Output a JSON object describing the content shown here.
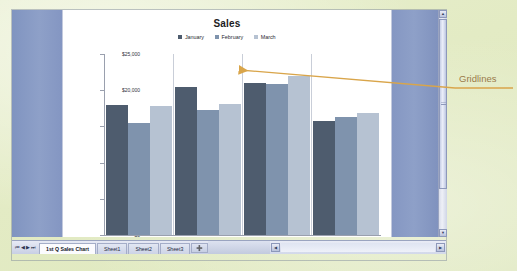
{
  "app": {
    "window_kind": "spreadsheet-chart-sheet"
  },
  "chart_data": {
    "type": "bar",
    "title": "Sales",
    "xlabel": "Month",
    "ylabel": "",
    "categories": [
      "East",
      "West",
      "North",
      "South"
    ],
    "series": [
      {
        "name": "January",
        "color": "#4e5c6e",
        "values": [
          18000,
          20400,
          21000,
          15800
        ]
      },
      {
        "name": "February",
        "color": "#7f93ad",
        "values": [
          15500,
          17200,
          20900,
          16300
        ]
      },
      {
        "name": "March",
        "color": "#b6c2d2",
        "values": [
          17800,
          18100,
          22000,
          16800
        ]
      }
    ],
    "ylim": [
      0,
      25000
    ],
    "yticks": [
      0,
      5000,
      10000,
      15000,
      20000,
      25000
    ],
    "ytick_labels": [
      "$0",
      "$5,000",
      "$10,000",
      "$15,000",
      "$20,000",
      "$25,000"
    ],
    "grid": "vertical-category-separators",
    "legend_position": "top"
  },
  "axis_title": {
    "text": "Month",
    "selected": true
  },
  "tabs": {
    "nav_first": "⏮",
    "nav_prev": "◀",
    "nav_next": "▶",
    "nav_last": "⏭",
    "items": [
      {
        "label": "1st Q Sales Chart",
        "active": true
      },
      {
        "label": "Sheet1",
        "active": false
      },
      {
        "label": "Sheet2",
        "active": false
      },
      {
        "label": "Sheet3",
        "active": false
      }
    ],
    "insert_label": "➕"
  },
  "scrollbars": {
    "v_up": "▲",
    "v_down": "▼",
    "h_left": "◀",
    "h_right": "▶"
  },
  "annotation": {
    "label": "Gridlines",
    "color": "#c49a55"
  }
}
